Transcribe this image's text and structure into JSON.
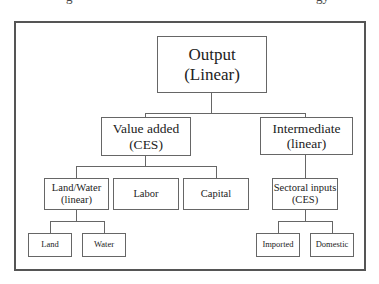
{
  "title_remnant": {
    "left_fragment": "g",
    "right_fragment": "gy"
  },
  "diagram": {
    "root": {
      "label": "Output",
      "sub": "(Linear)"
    },
    "value_added": {
      "label": "Value added",
      "sub": "(CES)"
    },
    "intermediate": {
      "label": "Intermediate",
      "sub": "(linear)"
    },
    "land_water": {
      "label": "Land/Water",
      "sub": "(linear)"
    },
    "labor": {
      "label": "Labor"
    },
    "capital": {
      "label": "Capital"
    },
    "sectoral_inputs": {
      "label": "Sectoral inputs",
      "sub": "(CES)"
    },
    "land": {
      "label": "Land"
    },
    "water": {
      "label": "Water"
    },
    "imported": {
      "label": "Imported"
    },
    "domestic": {
      "label": "Domestic"
    }
  }
}
